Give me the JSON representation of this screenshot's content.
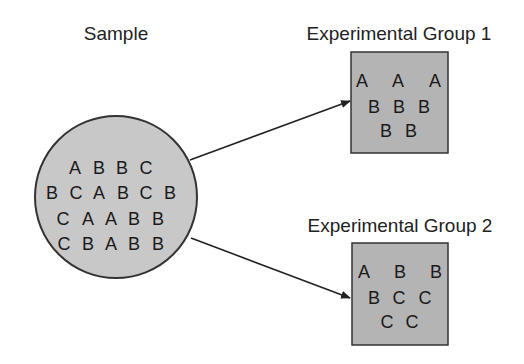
{
  "colors": {
    "background": "#ffffff",
    "circle_fill": "#c8c8c8",
    "box_fill": "#b4b4b4",
    "stroke": "#333333",
    "text": "#222222"
  },
  "sample": {
    "label": "Sample",
    "rows": [
      [
        "A",
        "B",
        "B",
        "C"
      ],
      [
        "B",
        "C",
        "A",
        "B",
        "C",
        "B"
      ],
      [
        "C",
        "A",
        "A",
        "B",
        "B"
      ],
      [
        "C",
        "B",
        "A",
        "B",
        "B"
      ]
    ]
  },
  "group1": {
    "label": "Experimental Group 1",
    "rows": [
      [
        "A",
        "A",
        "A"
      ],
      [
        "B",
        "B",
        "B"
      ],
      [
        "B",
        "B"
      ]
    ]
  },
  "group2": {
    "label": "Experimental Group 2",
    "rows": [
      [
        "A",
        "B",
        "B"
      ],
      [
        "B",
        "C",
        "C"
      ],
      [
        "C",
        "C"
      ]
    ]
  },
  "arrows": [
    {
      "from": "sample",
      "to": "group1"
    },
    {
      "from": "sample",
      "to": "group2"
    }
  ]
}
